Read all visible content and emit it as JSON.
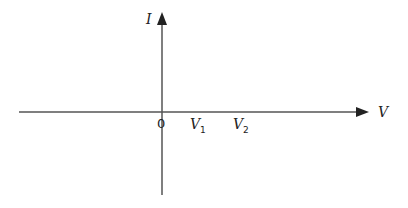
{
  "diagram": {
    "type": "axes",
    "y_axis": {
      "label": "I"
    },
    "x_axis": {
      "label": "V"
    },
    "origin_label": "0",
    "ticks": [
      {
        "base": "V",
        "sub": "1"
      },
      {
        "base": "V",
        "sub": "2"
      }
    ],
    "colors": {
      "axis": "#555555",
      "text": "#222222"
    }
  }
}
